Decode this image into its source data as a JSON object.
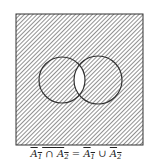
{
  "diagram": {
    "type": "venn",
    "universe_label": "",
    "sets": [
      {
        "name": "A1",
        "cx": 62,
        "cy": 80,
        "r": 23
      },
      {
        "name": "A2",
        "cx": 98,
        "cy": 80,
        "r": 24
      }
    ],
    "shaded_region": "complement of A1 ∩ A2",
    "unshaded_region": "A1 ∩ A2",
    "colors": {
      "hatch": "#555555",
      "background": "#ffffff",
      "outline": "#333333"
    }
  },
  "caption": {
    "lhs_set1": "A",
    "lhs_sub1": "1",
    "lhs_op": " ∩ ",
    "lhs_set2": "A",
    "lhs_sub2": "2",
    "eq": " = ",
    "rhs_set1": "A",
    "rhs_sub1": "1",
    "rhs_op": " ∪ ",
    "rhs_set2": "A",
    "rhs_sub2": "2"
  }
}
